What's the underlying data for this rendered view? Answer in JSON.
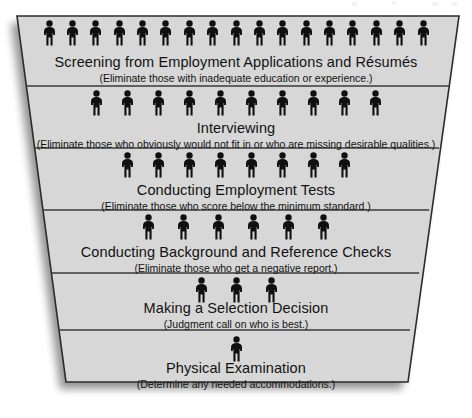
{
  "diagram": {
    "type": "funnel",
    "shape": "inverted-trapezoid",
    "band_count": 6,
    "fill_color": "#d7d7d7",
    "stroke_color": "#2b2b2b",
    "figure_color": "#101010",
    "background_color": "#ffffff",
    "shadow_color": "#b8b8b8",
    "stages": [
      {
        "index": 1,
        "title": "Screening from Employment Applications and Résumés",
        "subtitle": "(Eliminate those with inadequate education or experience.)",
        "figure_count": 17,
        "figure_icon": "person-pictogram-icon"
      },
      {
        "index": 2,
        "title": "Interviewing",
        "subtitle": "(Eliminate those who obviously would not fit in or who are missing desirable qualities.)",
        "figure_count": 10,
        "figure_icon": "person-pictogram-icon"
      },
      {
        "index": 3,
        "title": "Conducting Employment Tests",
        "subtitle": "(Eliminate those who score below the minimum standard.)",
        "figure_count": 8,
        "figure_icon": "person-pictogram-icon"
      },
      {
        "index": 4,
        "title": "Conducting Background and Reference Checks",
        "subtitle": "(Eliminate those who get a negative report.)",
        "figure_count": 6,
        "figure_icon": "person-pictogram-icon"
      },
      {
        "index": 5,
        "title": "Making a Selection Decision",
        "subtitle": "(Judgment call on who is best.)",
        "figure_count": 3,
        "figure_icon": "person-pictogram-icon"
      },
      {
        "index": 6,
        "title": "Physical Examination",
        "subtitle": "(Determine any needed accommodations.)",
        "figure_count": 1,
        "figure_icon": "person-pictogram-icon"
      }
    ]
  },
  "chart_data": {
    "type": "funnel",
    "categories": [
      "Screening from Employment Applications and Résumés",
      "Interviewing",
      "Conducting Employment Tests",
      "Conducting Background and Reference Checks",
      "Making a Selection Decision",
      "Physical Examination"
    ],
    "values": [
      17,
      10,
      8,
      6,
      3,
      1
    ],
    "value_unit": "candidates (pictogram figures)",
    "xlabel": "",
    "ylabel": "",
    "legend": "none",
    "grid": false
  }
}
